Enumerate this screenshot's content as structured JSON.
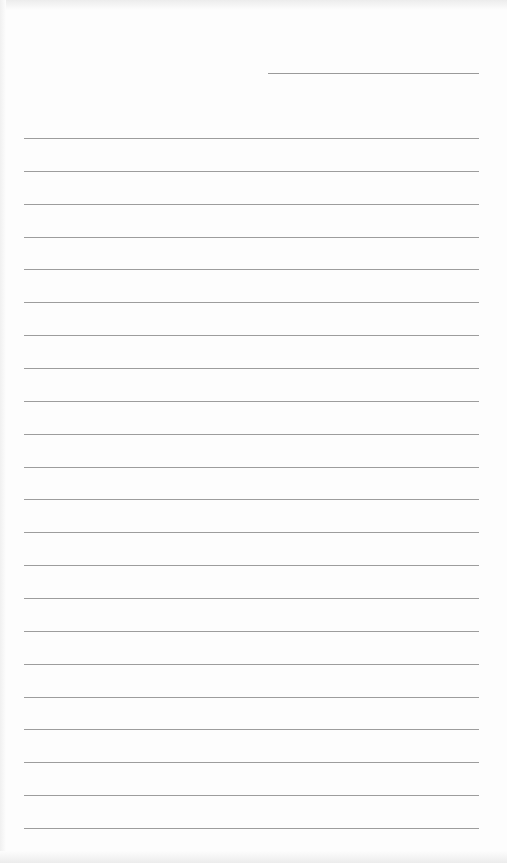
{
  "page": {
    "type": "blank lined notebook paper",
    "background_color": "#fdfdfd",
    "rule_color": "#9d9d9d",
    "date_line": {
      "x": 268,
      "y": 73,
      "width": 211,
      "text": ""
    },
    "rules": {
      "count": 22,
      "left": 24,
      "width": 455,
      "first_y": 138,
      "last_y": 828
    },
    "written_content": ""
  }
}
